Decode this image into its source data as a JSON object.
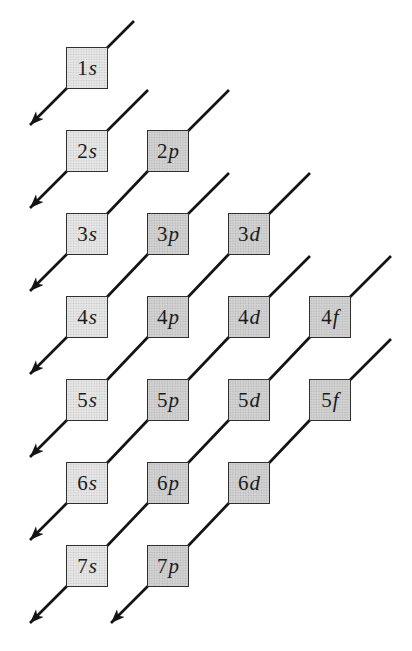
{
  "diagram": {
    "orbitals": [
      {
        "n": "1",
        "l": "s",
        "col": 0,
        "row": 0,
        "shade": "s"
      },
      {
        "n": "2",
        "l": "s",
        "col": 0,
        "row": 1,
        "shade": "s"
      },
      {
        "n": "2",
        "l": "p",
        "col": 1,
        "row": 1,
        "shade": "pdf"
      },
      {
        "n": "3",
        "l": "s",
        "col": 0,
        "row": 2,
        "shade": "s"
      },
      {
        "n": "3",
        "l": "p",
        "col": 1,
        "row": 2,
        "shade": "pdf"
      },
      {
        "n": "3",
        "l": "d",
        "col": 2,
        "row": 2,
        "shade": "pdf"
      },
      {
        "n": "4",
        "l": "s",
        "col": 0,
        "row": 3,
        "shade": "s"
      },
      {
        "n": "4",
        "l": "p",
        "col": 1,
        "row": 3,
        "shade": "pdf"
      },
      {
        "n": "4",
        "l": "d",
        "col": 2,
        "row": 3,
        "shade": "pdf"
      },
      {
        "n": "4",
        "l": "f",
        "col": 3,
        "row": 3,
        "shade": "pdf"
      },
      {
        "n": "5",
        "l": "s",
        "col": 0,
        "row": 4,
        "shade": "s"
      },
      {
        "n": "5",
        "l": "p",
        "col": 1,
        "row": 4,
        "shade": "pdf"
      },
      {
        "n": "5",
        "l": "d",
        "col": 2,
        "row": 4,
        "shade": "pdf"
      },
      {
        "n": "5",
        "l": "f",
        "col": 3,
        "row": 4,
        "shade": "pdf"
      },
      {
        "n": "6",
        "l": "s",
        "col": 0,
        "row": 5,
        "shade": "s"
      },
      {
        "n": "6",
        "l": "p",
        "col": 1,
        "row": 5,
        "shade": "pdf"
      },
      {
        "n": "6",
        "l": "d",
        "col": 2,
        "row": 5,
        "shade": "pdf"
      },
      {
        "n": "7",
        "l": "s",
        "col": 0,
        "row": 6,
        "shade": "s"
      },
      {
        "n": "7",
        "l": "p",
        "col": 1,
        "row": 6,
        "shade": "pdf"
      }
    ],
    "arrows": [
      {
        "name": "arrow-1",
        "through": [
          "1s"
        ],
        "tail_len": 26
      },
      {
        "name": "arrow-2",
        "through": [
          "2s"
        ],
        "tail_len": 40
      },
      {
        "name": "arrow-3",
        "through": [
          "2p",
          "3s"
        ],
        "tail_len": 40
      },
      {
        "name": "arrow-4",
        "through": [
          "3p",
          "4s"
        ],
        "tail_len": 40
      },
      {
        "name": "arrow-5",
        "through": [
          "3d",
          "4p",
          "5s"
        ],
        "tail_len": 40
      },
      {
        "name": "arrow-6",
        "through": [
          "4d",
          "5p",
          "6s"
        ],
        "tail_len": 40
      },
      {
        "name": "arrow-7",
        "through": [
          "4f",
          "5d",
          "6p",
          "7s"
        ],
        "tail_len": 40
      },
      {
        "name": "arrow-8",
        "through": [
          "5f",
          "6d",
          "7p"
        ],
        "tail_len": 40
      }
    ],
    "layout": {
      "canvas": [
        412,
        651
      ],
      "box_size": 42,
      "col_x": [
        87,
        168,
        249,
        330
      ],
      "row_y": [
        68,
        151,
        234,
        317,
        400,
        483,
        566
      ],
      "head_len": 36
    },
    "colors": {
      "background": "#ffffff",
      "s_box_fill": "#e8e8e8",
      "pdf_box_fill": "#d3d3d3",
      "box_border": "#2f2f2f",
      "arrow_line": "#141414",
      "label_text": "#1b1b1b"
    }
  }
}
